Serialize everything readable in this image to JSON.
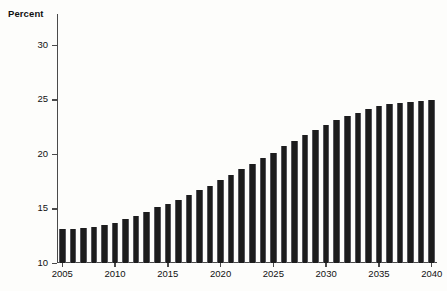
{
  "chart_data": {
    "type": "bar",
    "title": "",
    "subtitle": "",
    "xlabel": "",
    "ylabel": "Percent",
    "ylim": [
      10,
      30
    ],
    "xlim": [
      2005,
      2040
    ],
    "grid": false,
    "legend": null,
    "y_ticks": [
      10,
      15,
      20,
      25,
      30
    ],
    "y_tick_labels": [
      "10",
      "15",
      "20",
      "25",
      "30"
    ],
    "x_ticks": [
      2005,
      2010,
      2015,
      2020,
      2025,
      2030,
      2035,
      2040
    ],
    "x_tick_labels": [
      "2005",
      "2010",
      "2015",
      "2020",
      "2025",
      "2030",
      "2035",
      "2040"
    ],
    "bar_color": "#1c1c1c",
    "categories": [
      "2005",
      "2006",
      "2007",
      "2008",
      "2009",
      "2010",
      "2011",
      "2012",
      "2013",
      "2014",
      "2015",
      "2016",
      "2017",
      "2018",
      "2019",
      "2020",
      "2021",
      "2022",
      "2023",
      "2024",
      "2025",
      "2026",
      "2027",
      "2028",
      "2029",
      "2030",
      "2031",
      "2032",
      "2033",
      "2034",
      "2035",
      "2036",
      "2037",
      "2038",
      "2039",
      "2040"
    ],
    "values": [
      13.1,
      13.1,
      13.2,
      13.3,
      13.5,
      13.7,
      14.0,
      14.3,
      14.7,
      15.1,
      15.4,
      15.8,
      16.2,
      16.7,
      17.1,
      17.6,
      18.1,
      18.6,
      19.1,
      19.6,
      20.1,
      20.7,
      21.2,
      21.7,
      22.2,
      22.7,
      23.1,
      23.5,
      23.8,
      24.1,
      24.4,
      24.6,
      24.7,
      24.8,
      24.9,
      25.0
    ]
  }
}
